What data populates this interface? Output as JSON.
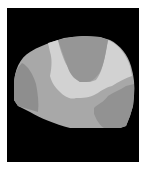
{
  "image": {
    "kind": "grayscale segmented brain slice",
    "background_color": "#ffffff",
    "frame_color": "#000000",
    "regions": [
      {
        "name": "outer-region",
        "color": "#a8a8a8"
      },
      {
        "name": "left-region",
        "color": "#8e8e8e"
      },
      {
        "name": "light-band",
        "color": "#d2d2d2"
      },
      {
        "name": "top-center-region",
        "color": "#969696"
      },
      {
        "name": "bottom-right-region",
        "color": "#929292"
      }
    ]
  }
}
